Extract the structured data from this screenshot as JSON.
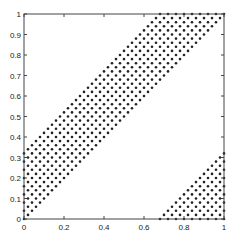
{
  "chart_data": {
    "type": "scatter",
    "title": "",
    "xlabel": "",
    "ylabel": "",
    "xlim": [
      0,
      1
    ],
    "ylim": [
      0,
      1
    ],
    "grid": false,
    "legend": null,
    "x_ticks": [
      "0",
      "0.2",
      "0.4",
      "0.6",
      "0.8",
      "1"
    ],
    "y_ticks": [
      "0",
      "0.1",
      "0.2",
      "0.3",
      "0.4",
      "0.5",
      "0.6",
      "0.7",
      "0.8",
      "0.9",
      "1"
    ],
    "marker": "dot",
    "marker_color": "#222222",
    "grid_spacing": 0.02,
    "regions": [
      {
        "name": "diagonal-band",
        "description": "points where x <= y <= x + 0.35",
        "lower": "y = x",
        "upper": "y = x + 0.35"
      },
      {
        "name": "lower-right-triangle",
        "description": "points where y <= x - 0.65",
        "vertices": [
          [
            0.65,
            0
          ],
          [
            1,
            0
          ],
          [
            1,
            0.35
          ]
        ]
      }
    ]
  }
}
